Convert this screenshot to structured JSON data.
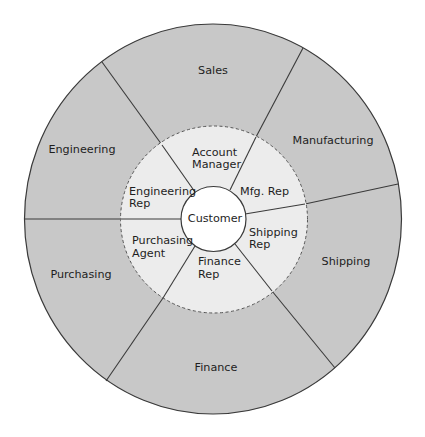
{
  "diagram": {
    "type": "concentric-wheel",
    "center": {
      "label": "Customer"
    },
    "inner_ring": {
      "style": "dashed",
      "segments": [
        {
          "id": "account-manager",
          "lines": [
            "Account",
            "Manager"
          ]
        },
        {
          "id": "mfg-rep",
          "lines": [
            "Mfg. Rep"
          ]
        },
        {
          "id": "shipping-rep",
          "lines": [
            "Shipping",
            "Rep"
          ]
        },
        {
          "id": "finance-rep",
          "lines": [
            "Finance",
            "Rep"
          ]
        },
        {
          "id": "purchasing-agent",
          "lines": [
            "Purchasing",
            "Agent"
          ]
        },
        {
          "id": "engineering-rep",
          "lines": [
            "Engineering",
            "Rep"
          ]
        }
      ]
    },
    "outer_ring": {
      "segments": [
        {
          "id": "sales",
          "label": "Sales"
        },
        {
          "id": "manufacturing",
          "label": "Manufacturing"
        },
        {
          "id": "shipping",
          "label": "Shipping"
        },
        {
          "id": "finance",
          "label": "Finance"
        },
        {
          "id": "purchasing",
          "label": "Purchasing"
        },
        {
          "id": "engineering",
          "label": "Engineering"
        }
      ]
    },
    "colors": {
      "outer_ring": "#c8c8c8",
      "inner_ring": "#ececec",
      "center": "#ffffff",
      "lines": "#3a3a3a",
      "text": "#1e1e1e"
    }
  }
}
